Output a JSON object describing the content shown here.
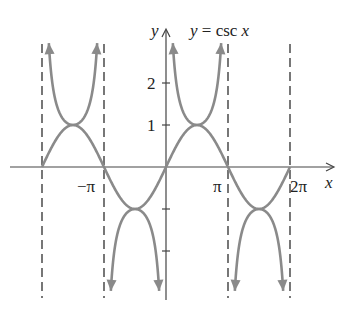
{
  "chart_data": {
    "type": "line",
    "title": "y = csc x",
    "xlabel": "x",
    "ylabel": "y",
    "x_ticks": [
      "-π",
      "π",
      "2π"
    ],
    "y_ticks": [
      "1",
      "2"
    ],
    "xlim": [
      -6.28,
      6.28
    ],
    "ylim": [
      -3,
      3
    ],
    "series": [
      {
        "name": "y = csc x",
        "style": "solid, arrows toward asymptotes",
        "color": "#888888"
      },
      {
        "name": "y = sin x",
        "style": "solid",
        "color": "#888888"
      }
    ],
    "asymptotes": [
      "x = -2π",
      "x = -π",
      "x = 0",
      "x = π",
      "x = 2π"
    ],
    "sample_points": [
      {
        "x": -4.712,
        "csc": 1,
        "sin": 1
      },
      {
        "x": -1.571,
        "csc": -1,
        "sin": -1
      },
      {
        "x": 1.571,
        "csc": 1,
        "sin": 1
      },
      {
        "x": 4.712,
        "csc": -1,
        "sin": -1
      }
    ],
    "grid": false
  },
  "labels": {
    "title": "y = csc x",
    "x_axis": "x",
    "y_axis": "y",
    "tick_neg_pi": "−π",
    "tick_pi": "π",
    "tick_2pi": "2π",
    "tick_1": "1",
    "tick_2": "2"
  },
  "colors": {
    "curve": "#8a8a8a",
    "axis": "#444444",
    "asymptote": "#555555"
  }
}
